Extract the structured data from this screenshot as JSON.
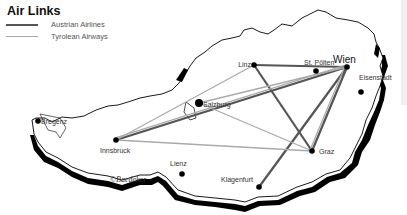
{
  "legend": {
    "title": "Air Links",
    "items": [
      {
        "label": "Austrian Airlines",
        "color": "#555555",
        "style": "dark"
      },
      {
        "label": "Tyrolean Airways",
        "color": "#aaaaaa",
        "style": "light"
      }
    ]
  },
  "cities": [
    {
      "id": "wien",
      "label": "Wien",
      "major": true
    },
    {
      "id": "st-poelten",
      "label": "St. Pölten",
      "major": false
    },
    {
      "id": "linz",
      "label": "Linz",
      "major": false
    },
    {
      "id": "eisenstadt",
      "label": "Eisenstadt",
      "major": false
    },
    {
      "id": "salzburg",
      "label": "Salzburg",
      "major": false
    },
    {
      "id": "bregenz",
      "label": "Bregenz",
      "major": false
    },
    {
      "id": "innsbruck",
      "label": "Innsbruck",
      "major": false
    },
    {
      "id": "lienz",
      "label": "Lienz",
      "major": false
    },
    {
      "id": "graz",
      "label": "Graz",
      "major": false
    },
    {
      "id": "klagenfurt",
      "label": "Klagenfurt",
      "major": false
    }
  ],
  "routes": [
    {
      "from": "Linz",
      "to": "Wien",
      "airline": "Austrian Airlines"
    },
    {
      "from": "Linz",
      "to": "Graz",
      "airline": "Austrian Airlines"
    },
    {
      "from": "Wien",
      "to": "Graz",
      "airline": "Austrian Airlines"
    },
    {
      "from": "Wien",
      "to": "Klagenfurt",
      "airline": "Austrian Airlines"
    },
    {
      "from": "Wien",
      "to": "Innsbruck",
      "airline": "Austrian Airlines"
    },
    {
      "from": "Wien",
      "to": "Salzburg",
      "airline": "Tyrolean Airways"
    },
    {
      "from": "Linz",
      "to": "Innsbruck",
      "airline": "Tyrolean Airways"
    },
    {
      "from": "Wien",
      "to": "Innsbruck",
      "airline": "Tyrolean Airways"
    },
    {
      "from": "Innsbruck",
      "to": "Graz",
      "airline": "Tyrolean Airways"
    },
    {
      "from": "Salzburg",
      "to": "Graz",
      "airline": "Tyrolean Airways"
    },
    {
      "from": "Wien",
      "to": "Graz",
      "airline": "Tyrolean Airways"
    }
  ],
  "credit": "©Baedeker"
}
